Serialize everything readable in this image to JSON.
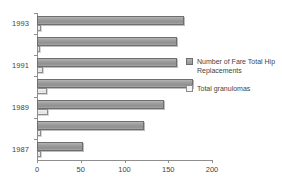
{
  "chart_data": {
    "type": "bar",
    "orientation": "horizontal",
    "title": "",
    "xlabel": "",
    "ylabel": "",
    "xlim": [
      0,
      200
    ],
    "xticks": [
      0,
      50,
      100,
      150,
      200
    ],
    "xtick_labels": [
      "0",
      "50",
      "100",
      "150",
      "200"
    ],
    "grid": false,
    "legend_position": "right",
    "categories": [
      "1987",
      "1988",
      "1989",
      "1990",
      "1991",
      "1992",
      "1993"
    ],
    "category_axis_labels": [
      "1987",
      "1989",
      "1991",
      "1993"
    ],
    "series": [
      {
        "name": "Number of Fare Total Hip Replacements",
        "color": "#9d9d9d",
        "values": [
          52,
          122,
          145,
          178,
          160,
          160,
          168
        ]
      },
      {
        "name": "Total granulomas",
        "color": "#f2f2f2",
        "values": [
          5,
          4,
          12,
          11,
          7,
          3,
          4
        ]
      }
    ]
  },
  "legend": {
    "items": [
      {
        "label": "Number of Fare Total Hip Replacements",
        "swatch": "legend-swatch-series0"
      },
      {
        "label": "Total granulomas",
        "swatch": "legend-swatch-series1"
      }
    ]
  }
}
